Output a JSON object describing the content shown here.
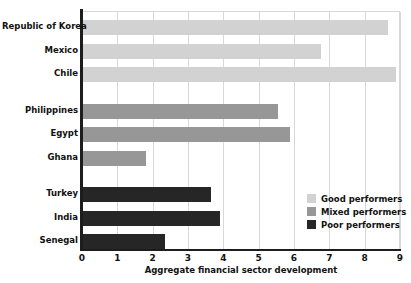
{
  "chart_data": {
    "type": "bar",
    "orientation": "horizontal",
    "title": "",
    "xlabel": "Aggregate financial sector development",
    "ylabel": "",
    "xlim": [
      0,
      9
    ],
    "xticks": [
      0,
      1,
      2,
      3,
      4,
      5,
      6,
      7,
      8,
      9
    ],
    "grid": "vertical",
    "legend_position": "inside-right-lower",
    "categories": [
      "Republic of Korea",
      "Mexico",
      "Chile",
      "Philippines",
      "Egypt",
      "Ghana",
      "Turkey",
      "India",
      "Senegal"
    ],
    "values": [
      8.65,
      6.75,
      8.9,
      5.55,
      5.9,
      1.8,
      3.65,
      3.9,
      2.35
    ],
    "groups": [
      "good",
      "good",
      "good",
      "mixed",
      "mixed",
      "mixed",
      "poor",
      "poor",
      "poor"
    ],
    "series": [
      {
        "name": "Good performers",
        "key": "good",
        "color": "#d2d2d2",
        "points": [
          {
            "category": "Republic of Korea",
            "value": 8.65
          },
          {
            "category": "Mexico",
            "value": 6.75
          },
          {
            "category": "Chile",
            "value": 8.9
          }
        ]
      },
      {
        "name": "Mixed performers",
        "key": "mixed",
        "color": "#979797",
        "points": [
          {
            "category": "Philippines",
            "value": 5.55
          },
          {
            "category": "Egypt",
            "value": 5.9
          },
          {
            "category": "Ghana",
            "value": 1.8
          }
        ]
      },
      {
        "name": "Poor performers",
        "key": "poor",
        "color": "#262626",
        "points": [
          {
            "category": "Turkey",
            "value": 3.65
          },
          {
            "category": "India",
            "value": 3.9
          },
          {
            "category": "Senegal",
            "value": 2.35
          }
        ]
      }
    ]
  },
  "axis": {
    "x_title": "Aggregate financial sector development",
    "tick_labels": [
      "0",
      "1",
      "2",
      "3",
      "4",
      "5",
      "6",
      "7",
      "8",
      "9"
    ]
  },
  "categories": [
    {
      "label": "Republic of Korea",
      "value": 8.65,
      "group": "good"
    },
    {
      "label": "Mexico",
      "value": 6.75,
      "group": "good"
    },
    {
      "label": "Chile",
      "value": 8.9,
      "group": "good"
    },
    {
      "label": "Philippines",
      "value": 5.55,
      "group": "mixed"
    },
    {
      "label": "Egypt",
      "value": 5.9,
      "group": "mixed"
    },
    {
      "label": "Ghana",
      "value": 1.8,
      "group": "mixed"
    },
    {
      "label": "Turkey",
      "value": 3.65,
      "group": "poor"
    },
    {
      "label": "India",
      "value": 3.9,
      "group": "poor"
    },
    {
      "label": "Senegal",
      "value": 2.35,
      "group": "poor"
    }
  ],
  "legend": {
    "items": [
      {
        "label": "Good performers",
        "key": "good",
        "color": "#d2d2d2"
      },
      {
        "label": "Mixed performers",
        "key": "mixed",
        "color": "#979797"
      },
      {
        "label": "Poor performers",
        "key": "poor",
        "color": "#262626"
      }
    ]
  },
  "colors": {
    "good": "#d2d2d2",
    "mixed": "#979797",
    "poor": "#262626",
    "axis": "#1d1d1d",
    "grid": "#d8d8d8",
    "background": "#ffffff",
    "text": "#111111"
  }
}
